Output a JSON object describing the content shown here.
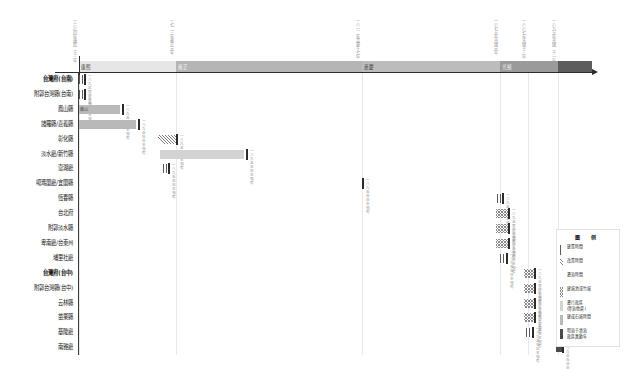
{
  "chart_data": {
    "type": "bar",
    "chart_kind": "gantt-timeline",
    "title": "",
    "xlabel": "",
    "ylabel": "",
    "grid": true,
    "legend_position": "bottom-right",
    "x_axis": {
      "label_rotation": 90,
      "tick_labels": [
        "一六八四年\n康熙二十三年",
        "一七二三年\n雍正元年",
        "一八一二年\n嘉慶十七年",
        "一八七五年\n光緒元年",
        "一八八七年\n光緒十三年",
        "一八九五年\n光緒二十一年"
      ],
      "tick_px": [
        79,
        176,
        362,
        500,
        528,
        558
      ]
    },
    "eras": [
      {
        "label": "康熙",
        "left": 79,
        "width": 97,
        "shade": "#e6e6e6",
        "dark": false
      },
      {
        "label": "雍正",
        "left": 176,
        "width": 186,
        "shade": "#b5b5b5",
        "dark": true
      },
      {
        "label": "嘉慶",
        "left": 362,
        "width": 138,
        "shade": "#bcbcbc",
        "dark": false
      },
      {
        "label": "光緒",
        "left": 500,
        "width": 58,
        "shade": "#9a9a9a",
        "dark": true
      },
      {
        "label": "",
        "left": 558,
        "width": 34,
        "shade": "#5d5d5d",
        "dark": true
      }
    ],
    "rows": [
      {
        "label": "台灣府(台南)",
        "bold": true,
        "bars": [
          {
            "start": 79,
            "end": 84,
            "fill": "hatch-v"
          }
        ],
        "end_mark": 84,
        "end_note": "一八九五年\n日本領有"
      },
      {
        "label": "附郭台灣縣(台南)",
        "bold": false,
        "bars": [
          {
            "start": 79,
            "end": 84,
            "fill": "hatch-v"
          }
        ],
        "end_mark": 84,
        "end_note": "一八九五年\n日本領有"
      },
      {
        "label": "鳳山縣",
        "bold": false,
        "bars": [
          {
            "start": 79,
            "end": 120,
            "fill": "solid-mid",
            "text": "鳳山"
          }
        ],
        "end_mark": 122,
        "end_note": "一八九五年\n日本領有"
      },
      {
        "label": "諸羅縣/嘉義縣",
        "bold": false,
        "bars": [
          {
            "start": 79,
            "end": 136,
            "fill": "solid-mid"
          }
        ],
        "end_mark": 138,
        "end_note": "一八九五年\n日本領有"
      },
      {
        "label": "彰化縣",
        "bold": false,
        "bars": [
          {
            "start": 158,
            "end": 176,
            "fill": "hatch-d"
          }
        ],
        "end_mark": 176,
        "end_note": "一八九五年\n日本領有"
      },
      {
        "label": "淡水廳/新竹縣",
        "bold": false,
        "bars": [
          {
            "start": 160,
            "end": 244,
            "fill": "solid-light"
          }
        ],
        "end_mark": 246,
        "end_note": "一八九五年\n日本領有"
      },
      {
        "label": "澎湖廳",
        "bold": false,
        "bars": [
          {
            "start": 163,
            "end": 168,
            "fill": "hatch-v"
          }
        ],
        "end_mark": 168,
        "end_note": "一八九五年\n日本領有"
      },
      {
        "label": "噶瑪蘭廳/宜蘭縣",
        "bold": false,
        "bars": [
          {
            "start": 354,
            "end": 362,
            "fill": "hatch-dot"
          }
        ],
        "end_mark": 362,
        "end_note": "一八九五年\n日本領有"
      },
      {
        "label": "恆春縣",
        "bold": false,
        "bars": [
          {
            "start": 497,
            "end": 502,
            "fill": "hatch-v"
          }
        ],
        "end_mark": 502,
        "end_note": "一八九五年\n日本領有"
      },
      {
        "label": "台北府",
        "bold": false,
        "bars": [
          {
            "start": 496,
            "end": 508,
            "fill": "hatch-cross"
          }
        ],
        "end_mark": 508,
        "end_note": "一八九五年\n日本領有"
      },
      {
        "label": "附郭淡水縣",
        "bold": false,
        "bars": [
          {
            "start": 496,
            "end": 508,
            "fill": "hatch-cross"
          }
        ],
        "end_mark": 508,
        "end_note": "一八九五年\n日本領有"
      },
      {
        "label": "卑南廳/台東州",
        "bold": false,
        "bars": [
          {
            "start": 496,
            "end": 508,
            "fill": "hatch-cross"
          }
        ],
        "end_mark": 508,
        "end_note": "一八九五年\n日本領有"
      },
      {
        "label": "埔里社廳",
        "bold": false,
        "bars": [
          {
            "start": 500,
            "end": 506,
            "fill": "hatch-v"
          }
        ],
        "end_mark": 506,
        "end_note": "一八九五年\n日本領有"
      },
      {
        "label": "台灣府(台中)",
        "bold": true,
        "bars": [
          {
            "start": 524,
            "end": 534,
            "fill": "hatch-cross"
          }
        ],
        "end_mark": 534,
        "end_note": "一八九五年\n日本領有"
      },
      {
        "label": "附郭台灣縣(台中)",
        "bold": false,
        "bars": [
          {
            "start": 524,
            "end": 534,
            "fill": "hatch-cross"
          }
        ],
        "end_mark": 534,
        "end_note": "一八九五年\n日本領有"
      },
      {
        "label": "云林縣",
        "bold": false,
        "bars": [
          {
            "start": 524,
            "end": 534,
            "fill": "hatch-cross"
          }
        ],
        "end_mark": 534,
        "end_note": "一八九五年\n日本領有"
      },
      {
        "label": "苗栗縣",
        "bold": false,
        "bars": [
          {
            "start": 524,
            "end": 534,
            "fill": "hatch-cross"
          }
        ],
        "end_mark": 534,
        "end_note": "一八九五年\n日本領有"
      },
      {
        "label": "基隆廳",
        "bold": false,
        "bars": [
          {
            "start": 526,
            "end": 532,
            "fill": "hatch-v"
          }
        ],
        "end_mark": 532,
        "end_note": "一八九五年\n日本領有"
      },
      {
        "label": "南雅廳",
        "bold": false,
        "bars": [
          {
            "start": 556,
            "end": 562,
            "fill": "solid-dark"
          }
        ],
        "end_mark": 562,
        "end_note": "一八九五年\n日本領有"
      }
    ],
    "legend": {
      "title": "圖　例",
      "items": [
        {
          "swatch": "hatch-v",
          "text": "建置時間"
        },
        {
          "swatch": "hatch-d",
          "text": "改置時間"
        },
        {
          "swatch": "hatch-dot",
          "text": "遷治時間"
        },
        {
          "swatch": "hatch-cross",
          "text": "建城池或竹城"
        },
        {
          "swatch": "solid-light",
          "text": "遷行政區\n(寄治他處)"
        },
        {
          "swatch": "solid-mid",
          "text": "建成石城時間"
        },
        {
          "swatch": "solid-dark",
          "text": "明治于清治\n政區異動年"
        }
      ]
    }
  }
}
